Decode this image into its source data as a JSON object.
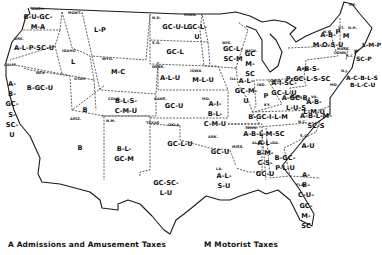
{
  "map": {
    "title": "State Taxes by Category",
    "states": [
      {
        "abbr": "WASH.",
        "codes": "B-U-GC-\nM-A"
      },
      {
        "abbr": "ORE.",
        "codes": "A-L-P-SC-U"
      },
      {
        "abbr": "CALIF.",
        "codes": "A-\nB-\nGC-\nS-\nSC-\nU"
      },
      {
        "abbr": "NEV.",
        "codes": "B-GC-U"
      },
      {
        "abbr": "IDAHO",
        "codes": "L"
      },
      {
        "abbr": "MONT.",
        "codes": "L-P"
      },
      {
        "abbr": "WYO.",
        "codes": "M-C"
      },
      {
        "abbr": "UTAH",
        "codes": "B"
      },
      {
        "abbr": "COLO.",
        "codes": "B-L-S-\nC-M-U"
      },
      {
        "abbr": "ARIZ.",
        "codes": "B"
      },
      {
        "abbr": "N.M.",
        "codes": "B-L-\nGC-M"
      },
      {
        "abbr": "N.D.",
        "codes": "GC-U-L"
      },
      {
        "abbr": "S.D.",
        "codes": "GC-L"
      },
      {
        "abbr": "NEBR.",
        "codes": "A-L-U"
      },
      {
        "abbr": "KANS.",
        "codes": "GC-U"
      },
      {
        "abbr": "OKLA.",
        "codes": "GC-L-U"
      },
      {
        "abbr": "TEXAS",
        "codes": "GC-SC-\nL-U"
      },
      {
        "abbr": "MINN.",
        "codes": "GC-L-\nU"
      },
      {
        "abbr": "IOWA",
        "codes": "M-L-U"
      },
      {
        "abbr": "MO.",
        "codes": "A-I-\nB-L-\nC-M-U"
      },
      {
        "abbr": "ARK.",
        "codes": "GC-U"
      },
      {
        "abbr": "LA.",
        "codes": "A-L-\nS-U"
      },
      {
        "abbr": "WIS.",
        "codes": "GC-L-\nSC-M"
      },
      {
        "abbr": "ILL.",
        "codes": "A-L-\nGC-M-\nU"
      },
      {
        "abbr": "MICH.",
        "codes": "GC\nM-\nSC"
      },
      {
        "abbr": "IND.",
        "codes": "P"
      },
      {
        "abbr": "OHIO",
        "codes": "A-I-SC-\nGC-L-U"
      },
      {
        "abbr": "KY.",
        "codes": "B-GC-I-L-M"
      },
      {
        "abbr": "TENN.",
        "codes": "A-B-L-M-SC"
      },
      {
        "abbr": "MISS.",
        "codes": ""
      },
      {
        "abbr": "ALA.",
        "codes": "A-L-\nB-M-\nC-S-\nGC-U"
      },
      {
        "abbr": "GA.",
        "codes": "B-GC-\nP-L-U"
      },
      {
        "abbr": "FLA.",
        "codes": "A-\nB-\nC-U-\nGC-\nM-\nSC"
      },
      {
        "abbr": "S.C.",
        "codes": "A-U"
      },
      {
        "abbr": "N.C.",
        "codes": "A-B-L-M-\nSC-S"
      },
      {
        "abbr": "VA.",
        "codes": "A-B-\nL-M-U"
      },
      {
        "abbr": "W.VA.",
        "codes": "A-GC-B-\nL-U-S"
      },
      {
        "abbr": "PA.",
        "codes": "A-B-S-\nP-GC-L-S-SC"
      },
      {
        "abbr": "N.Y.",
        "codes": "A-B-\nM-O-S-U"
      },
      {
        "abbr": "VT.",
        "codes": "P"
      },
      {
        "abbr": "N.H.",
        "codes": "M"
      },
      {
        "abbr": "ME.",
        "codes": ""
      },
      {
        "abbr": "MASS.",
        "codes": "L-M-P"
      },
      {
        "abbr": "CONN.",
        "codes": "P"
      },
      {
        "abbr": "R.I.",
        "codes": "SC-P"
      },
      {
        "abbr": "N.J.",
        "codes": "A-C-B-L-S"
      },
      {
        "abbr": "MD.",
        "codes": "B-L-C-U"
      }
    ]
  },
  "legend": [
    {
      "key": "A",
      "label": "Admissions and Amusement Taxes"
    },
    {
      "key": "M",
      "label": "Motorist Taxes"
    }
  ]
}
